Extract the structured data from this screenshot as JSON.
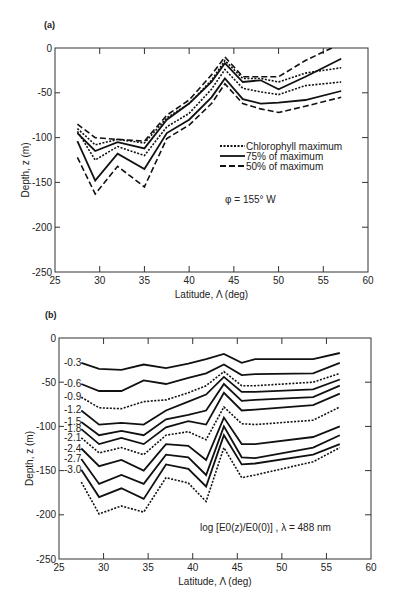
{
  "chart_data": [
    {
      "panel": "(a)",
      "type": "line",
      "title": "",
      "xlabel": "Latitude, Λ (deg)",
      "ylabel": "Depth, z (m)",
      "xlim": [
        25,
        60
      ],
      "ylim": [
        -250,
        0
      ],
      "xticks": [
        25,
        30,
        35,
        40,
        45,
        50,
        55,
        60
      ],
      "yticks": [
        0,
        -50,
        -100,
        -150,
        -200,
        -250
      ],
      "grid": false,
      "legend": {
        "position": "center-right",
        "entries": [
          {
            "label": "Chlorophyll maximum",
            "style": "dotted"
          },
          {
            "label": "75% of maximum",
            "style": "solid"
          },
          {
            "label": "50% of maximum",
            "style": "dashed"
          }
        ]
      },
      "annotation": "φ = 155° W",
      "x": [
        27.5,
        29.5,
        32,
        35,
        37.5,
        40,
        42.5,
        44,
        46,
        48,
        50,
        53,
        57
      ],
      "series": [
        {
          "name": "50% of maximum (upper)",
          "style": "dashed",
          "values": [
            -85,
            -100,
            -102,
            -104,
            -75,
            -58,
            -30,
            -10,
            -32,
            -32,
            -32,
            -14,
            5
          ]
        },
        {
          "name": "75% of maximum (upper)",
          "style": "solid",
          "values": [
            -95,
            -115,
            -105,
            -112,
            -80,
            -62,
            -38,
            -17,
            -38,
            -36,
            -46,
            -32,
            -12
          ]
        },
        {
          "name": "Chlorophyll maximum (upper)",
          "style": "dotted",
          "values": [
            -90,
            -108,
            -102,
            -106,
            -78,
            -62,
            -36,
            -14,
            -34,
            -34,
            -38,
            -28,
            -22
          ]
        },
        {
          "name": "Chlorophyll maximum",
          "style": "dotted",
          "values": [
            -93,
            -125,
            -110,
            -120,
            -88,
            -73,
            -46,
            -24,
            -45,
            -49,
            -52,
            -42,
            -38
          ]
        },
        {
          "name": "75% of maximum (lower)",
          "style": "solid",
          "values": [
            -104,
            -148,
            -118,
            -135,
            -95,
            -80,
            -55,
            -34,
            -57,
            -62,
            -61,
            -58,
            -48
          ]
        },
        {
          "name": "50% of maximum (lower)",
          "style": "dashed",
          "values": [
            -122,
            -163,
            -132,
            -155,
            -101,
            -86,
            -62,
            -40,
            -62,
            -68,
            -72,
            -65,
            -55
          ]
        }
      ]
    },
    {
      "panel": "(b)",
      "type": "line",
      "title": "",
      "xlabel": "Latitude, Λ (deg)",
      "ylabel": "Depth, z (m)",
      "xlim": [
        25,
        60
      ],
      "ylim": [
        -250,
        0
      ],
      "xticks": [
        25,
        30,
        35,
        40,
        45,
        50,
        55,
        60
      ],
      "yticks": [
        0,
        -50,
        -100,
        -150,
        -200,
        -250
      ],
      "grid": false,
      "annotation": "log [E0(z)/E0(0)] , λ = 488 nm",
      "x": [
        27.5,
        29.5,
        32,
        34.5,
        37,
        39.5,
        41.5,
        43.5,
        45.5,
        47,
        53.5,
        56.5
      ],
      "series": [
        {
          "name": "-0.3",
          "style": "solid",
          "values": [
            -28,
            -35,
            -36,
            -30,
            -34,
            -29,
            -24,
            -18,
            -28,
            -24,
            -24,
            -17
          ]
        },
        {
          "name": "-0.6",
          "style": "solid",
          "values": [
            -52,
            -60,
            -60,
            -48,
            -52,
            -45,
            -40,
            -30,
            -42,
            -41,
            -40,
            -28
          ]
        },
        {
          "name": "-0.9",
          "style": "dotted",
          "values": [
            -67,
            -79,
            -80,
            -72,
            -70,
            -62,
            -54,
            -38,
            -54,
            -54,
            -50,
            -40
          ]
        },
        {
          "name": "-1.2",
          "style": "solid",
          "values": [
            -82,
            -98,
            -96,
            -98,
            -82,
            -72,
            -64,
            -44,
            -61,
            -61,
            -58,
            -47
          ]
        },
        {
          "name": "-1.5",
          "style": "solid",
          "values": [
            -95,
            -110,
            -105,
            -110,
            -92,
            -87,
            -82,
            -52,
            -71,
            -70,
            -67,
            -54
          ]
        },
        {
          "name": "-1.8",
          "style": "solid",
          "values": [
            -103,
            -120,
            -113,
            -120,
            -101,
            -94,
            -98,
            -62,
            -82,
            -81,
            -76,
            -63
          ]
        },
        {
          "name": "-2.1",
          "style": "dotted",
          "values": [
            -113,
            -130,
            -124,
            -132,
            -110,
            -106,
            -115,
            -78,
            -97,
            -98,
            -93,
            -78
          ]
        },
        {
          "name": "-2.4",
          "style": "solid",
          "values": [
            -125,
            -145,
            -138,
            -150,
            -120,
            -122,
            -138,
            -90,
            -120,
            -120,
            -112,
            -100
          ]
        },
        {
          "name": "-2.7",
          "style": "solid",
          "values": [
            -137,
            -165,
            -155,
            -165,
            -132,
            -135,
            -155,
            -100,
            -135,
            -136,
            -124,
            -110
          ]
        },
        {
          "name": "-3.0",
          "style": "solid",
          "values": [
            -149,
            -180,
            -170,
            -182,
            -143,
            -148,
            -168,
            -110,
            -143,
            -142,
            -132,
            -120
          ]
        },
        {
          "name": "-3.3",
          "style": "dotted",
          "values": [
            -163,
            -199,
            -190,
            -197,
            -158,
            -164,
            -185,
            -124,
            -158,
            -155,
            -140,
            -124
          ]
        }
      ],
      "curve_labels": [
        "-0.3",
        "-0.6",
        "-0.9",
        "-1.2",
        "-1.5",
        "-1.8",
        "-2.1",
        "-2.4",
        "-2.7",
        "-3.0"
      ]
    }
  ],
  "panels": {
    "a": {
      "label": "(a)",
      "xlabel": "Latitude, Λ (deg)",
      "ylabel": "Depth, z (m)",
      "annotation": "φ = 155° W",
      "legend": [
        "Chlorophyll maximum",
        "75% of maximum",
        "50% of maximum"
      ]
    },
    "b": {
      "label": "(b)",
      "xlabel": "Latitude, Λ (deg)",
      "ylabel": "Depth, z (m)",
      "annotation": "log [E0(z)/E0(0)] , λ = 488 nm"
    }
  }
}
